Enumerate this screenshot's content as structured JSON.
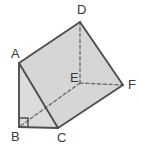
{
  "figure": {
    "type": "3d-solid-diagram",
    "canvas": {
      "width": 141,
      "height": 145
    },
    "colors": {
      "face_fill": "#d6d6d6",
      "face_fill_light": "#dcdcdc",
      "edge_stroke": "#4f4f4f",
      "hidden_edge_stroke": "#6e6e6e",
      "label_color": "#3a3a3a",
      "background": "#ffffff"
    },
    "vertices": [
      {
        "id": "A",
        "label": "A",
        "x": 19,
        "y": 63,
        "label_x": 11,
        "label_y": 58,
        "hidden": false
      },
      {
        "id": "B",
        "label": "B",
        "x": 19,
        "y": 127,
        "label_x": 11,
        "label_y": 141,
        "hidden": false
      },
      {
        "id": "C",
        "label": "C",
        "x": 58,
        "y": 128,
        "label_x": 57,
        "label_y": 142,
        "hidden": false
      },
      {
        "id": "D",
        "label": "D",
        "x": 80,
        "y": 22,
        "label_x": 77,
        "label_y": 14,
        "hidden": false
      },
      {
        "id": "E",
        "label": "E",
        "x": 80,
        "y": 83,
        "label_x": 70,
        "label_y": 82,
        "hidden": true
      },
      {
        "id": "F",
        "label": "F",
        "x": 123,
        "y": 85,
        "label_x": 128,
        "label_y": 89,
        "hidden": false
      }
    ],
    "faces": [
      {
        "id": "face-ADFC",
        "path": "M19,63 L80,22 L123,85 L58,128 Z",
        "shade": "#d6d6d6"
      },
      {
        "id": "face-ABC",
        "path": "M19,63 L19,127 L58,128 Z",
        "shade": "#dcdcdc"
      }
    ],
    "edges": [
      {
        "id": "edge-AD",
        "from": "A",
        "to": "D",
        "style": "solid"
      },
      {
        "id": "edge-DF",
        "from": "D",
        "to": "F",
        "style": "solid"
      },
      {
        "id": "edge-FC",
        "from": "F",
        "to": "C",
        "style": "solid"
      },
      {
        "id": "edge-CB",
        "from": "C",
        "to": "B",
        "style": "solid"
      },
      {
        "id": "edge-BA",
        "from": "B",
        "to": "A",
        "style": "solid"
      },
      {
        "id": "edge-AC",
        "from": "A",
        "to": "C",
        "style": "solid"
      },
      {
        "id": "edge-DE",
        "from": "D",
        "to": "E",
        "style": "dashed"
      },
      {
        "id": "edge-EF",
        "from": "E",
        "to": "F",
        "style": "dashed"
      },
      {
        "id": "edge-EB",
        "from": "E",
        "to": "B",
        "style": "dashed"
      }
    ],
    "markers": [
      {
        "id": "right-angle-at-B",
        "kind": "right-angle",
        "at_vertex": "B",
        "path": "M19,118 L28,118 L28,127"
      }
    ]
  }
}
